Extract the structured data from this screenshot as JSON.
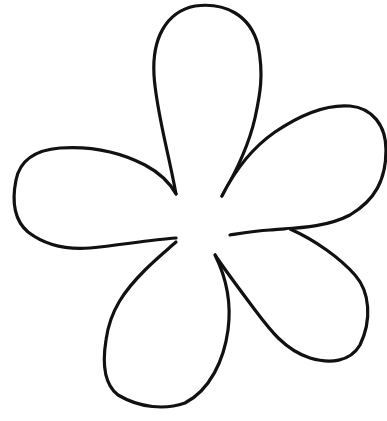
{
  "image": {
    "subject": "five-petal flower outline",
    "style": "black line art on white background",
    "colors": {
      "background": "#ffffff",
      "stroke": "#111111"
    },
    "petals": [
      {
        "name": "top-petal"
      },
      {
        "name": "right-petal"
      },
      {
        "name": "lower-right-petal"
      },
      {
        "name": "bottom-petal"
      },
      {
        "name": "left-petal"
      }
    ]
  }
}
